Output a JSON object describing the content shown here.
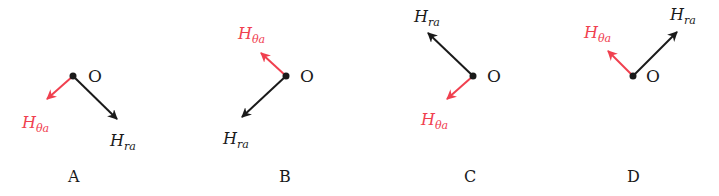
{
  "colors": {
    "black": "#1a1a1a",
    "red": "#f0404f"
  },
  "panels": [
    {
      "label": "A",
      "origin_label": "O",
      "h_theta": "H",
      "h_theta_sub": "θa",
      "h_r": "H",
      "h_r_sub": "ra"
    },
    {
      "label": "B",
      "origin_label": "O",
      "h_theta": "H",
      "h_theta_sub": "θa",
      "h_r": "H",
      "h_r_sub": "ra"
    },
    {
      "label": "C",
      "origin_label": "O",
      "h_theta": "H",
      "h_theta_sub": "θa",
      "h_r": "H",
      "h_r_sub": "ra"
    },
    {
      "label": "D",
      "origin_label": "O",
      "h_theta": "H",
      "h_theta_sub": "θa",
      "h_r": "H",
      "h_r_sub": "ra"
    }
  ]
}
